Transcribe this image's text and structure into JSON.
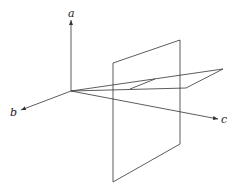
{
  "diagram": {
    "type": "3d-axes-with-planes",
    "axes": {
      "a": {
        "label": "a"
      },
      "b": {
        "label": "b"
      },
      "c": {
        "label": "c"
      }
    },
    "elements": [
      "vertical-plane",
      "horizontal-wedge-plane",
      "intersection-segment"
    ],
    "colors": {
      "stroke": "#333333",
      "background": "#ffffff"
    }
  }
}
